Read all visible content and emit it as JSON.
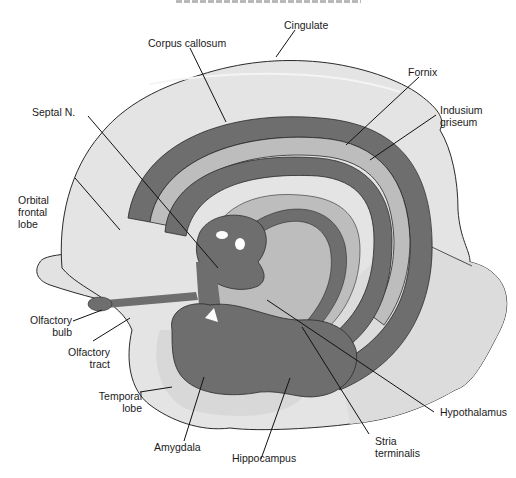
{
  "figure": {
    "type": "anatomical-diagram"
  },
  "colors": {
    "background": "#ffffff",
    "cortex_fill": "#e4e4e4",
    "mid_fill": "#bdbdbd",
    "dark_structure": "#6e6e6e",
    "outline": "#2a2a2a",
    "leader_line": "#111111"
  },
  "labels": {
    "cingulate": "Cingulate",
    "corpus_callosum": "Corpus callosum",
    "fornix": "Fornix",
    "indusium_line1": "Indusium",
    "indusium_line2": "griseum",
    "septal": "Septal N.",
    "orbital_line1": "Orbital",
    "orbital_line2": "frontal",
    "orbital_line3": "lobe",
    "olf_bulb_line1": "Olfactory",
    "olf_bulb_line2": "bulb",
    "olf_tract_line1": "Olfactory",
    "olf_tract_line2": "tract",
    "temporal_line1": "Temporal",
    "temporal_line2": "lobe",
    "amygdala": "Amygdala",
    "hippocampus": "Hippocampus",
    "stria_line1": "Stria",
    "stria_line2": "terminalis",
    "hypothalamus": "Hypothalamus"
  }
}
